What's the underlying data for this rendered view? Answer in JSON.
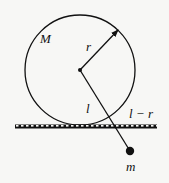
{
  "diagram": {
    "labels": {
      "large_mass": "M",
      "radius": "r",
      "rod_length": "l",
      "below_ground_length": "l − r",
      "small_mass": "m"
    },
    "colors": {
      "ink": "#111111",
      "background": "#f7f7f5"
    }
  }
}
